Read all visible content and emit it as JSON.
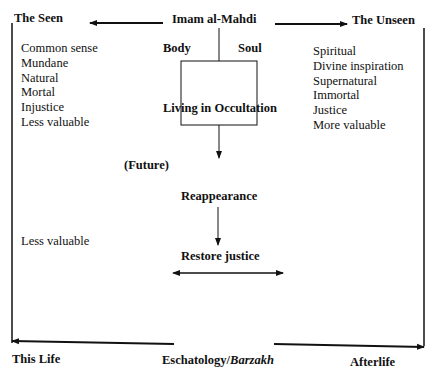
{
  "diagram": {
    "top": {
      "center": "Imam al-Mahdi",
      "left": "The Seen",
      "right": "The Unseen"
    },
    "seen_list": [
      "Common sense",
      "Mundane",
      "Natural",
      "Mortal",
      "Injustice",
      "Less valuable"
    ],
    "unseen_list": [
      "Spiritual",
      "Divine inspiration",
      "Supernatural",
      "Immortal",
      "Justice",
      "More valuable"
    ],
    "box": {
      "body_label": "Body",
      "soul_label": "Soul",
      "center_label": "Living in Occultation"
    },
    "flow": {
      "future": "(Future)",
      "reappearance": "Reappearance",
      "restore": "Restore justice"
    },
    "left_extra": "Less valuable",
    "bottom": {
      "left": "This Life",
      "center_prefix": "Eschatology/",
      "center_italic": "Barzakh",
      "right": "Afterlife"
    },
    "colors": {
      "line": "#111111",
      "background": "#ffffff"
    }
  }
}
